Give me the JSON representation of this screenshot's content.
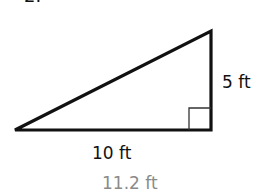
{
  "problem": {
    "number": "2."
  },
  "figure": {
    "shape": "right-triangle",
    "stroke_color": "#111111",
    "right_angle_marker": true,
    "vertices": {
      "left": [
        15,
        130
      ],
      "top_right": [
        211,
        31
      ],
      "bottom_right": [
        211,
        130
      ]
    }
  },
  "labels": {
    "vertical_leg": "5 ft",
    "horizontal_leg": "10 ft",
    "answer": "11.2 ft"
  },
  "colors": {
    "text": "#111111",
    "answer_text": "#8a8a8a",
    "background": "#ffffff"
  }
}
